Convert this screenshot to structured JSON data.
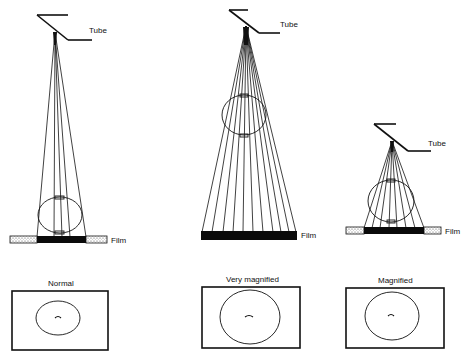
{
  "diagram": {
    "type": "radiographic magnification illustration",
    "setups": [
      {
        "id": "normal",
        "tube_label": "Tube",
        "film_label": "Film",
        "result_label": "Normal",
        "rays": 5
      },
      {
        "id": "very-magnified",
        "tube_label": "Tube",
        "film_label": "Film",
        "result_label": "Very magnified",
        "rays": 11
      },
      {
        "id": "magnified",
        "tube_label": "Tube",
        "film_label": "Film",
        "result_label": "Magnified",
        "rays": 8
      }
    ],
    "colors": {
      "line": "#111111",
      "film": "#0a0a0a",
      "stipple_pad": "#d9d9d9",
      "background": "#ffffff"
    }
  }
}
